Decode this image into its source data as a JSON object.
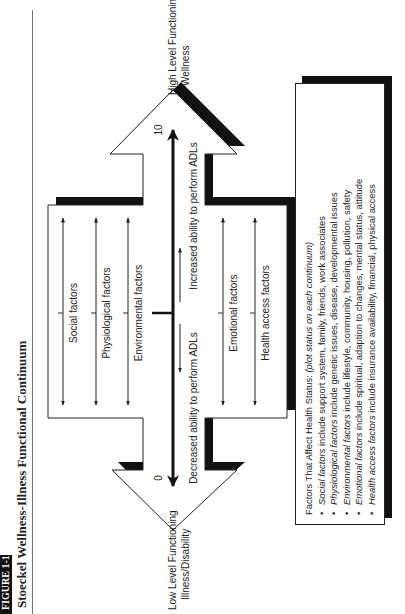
{
  "figure": {
    "label": "FIGURE 1-1",
    "title": "Stoeckel Wellness-Illness Functional Continuum"
  },
  "continuum": {
    "left_end": {
      "line1": "Low Level Functioning",
      "line2": "Illness/Disability"
    },
    "right_end": {
      "line1": "High Level Functioning",
      "line2": "Wellness"
    },
    "scale_min": "0",
    "scale_max": "10",
    "decreased_label": "Decreased ability to perform ADLs",
    "increased_label": "Increased ability to perform ADLs"
  },
  "factors_above": [
    {
      "label": "Social factors"
    },
    {
      "label": "Physiological factors"
    },
    {
      "label": "Environmental factors"
    }
  ],
  "factors_below": [
    {
      "label": "Emotional factors"
    },
    {
      "label": "Health access factors"
    }
  ],
  "legend": {
    "heading": "Factors That Affect Health Status: ",
    "heading_note": "(plot status on each continuum)",
    "bullet": "•",
    "items": [
      {
        "term": "Social factors",
        "desc": " include support system, family, friends, work associates"
      },
      {
        "term": "Physiological factors",
        "desc": " include genetic issues, disease, developmental issues"
      },
      {
        "term": "Environmental factors",
        "desc": " include lifestyle, community, housing, pollution, safety"
      },
      {
        "term": "Emotional factors",
        "desc": " include spiritual, adaption to changes, mental status, attitude"
      },
      {
        "term": "Health access factors",
        "desc": " include insurance availability, financial, physical access"
      }
    ]
  },
  "colors": {
    "outline": "#222222",
    "shadow": "#111111",
    "fill": "#ffffff",
    "text": "#222222"
  }
}
